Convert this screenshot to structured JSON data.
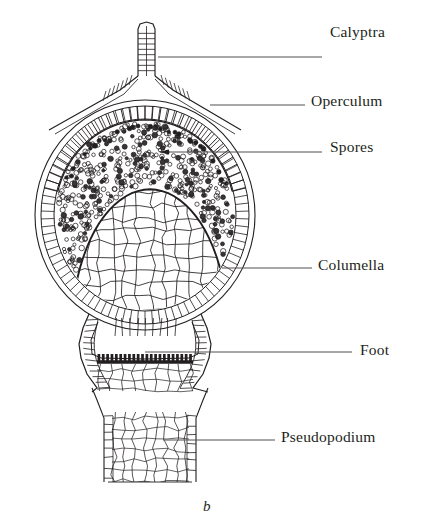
{
  "figure": {
    "caption": "b",
    "caption_x": 203,
    "caption_y": 498,
    "background": "#ffffff",
    "ink": "#231f20",
    "line_color": "#55514f"
  },
  "labels": [
    {
      "id": "calyptra",
      "text": "Calyptra",
      "text_x": 330,
      "text_y": 23,
      "leader": {
        "x1": 158,
        "y1": 57,
        "x2": 322,
        "y2": 57
      },
      "terminus": "none"
    },
    {
      "id": "operculum",
      "text": "Operculum",
      "text_x": 311,
      "text_y": 92,
      "leader": {
        "x1": 210,
        "y1": 105,
        "x2": 305,
        "y2": 105
      },
      "terminus": "none"
    },
    {
      "id": "spores",
      "text": "Spores",
      "text_x": 330,
      "text_y": 138,
      "leader": {
        "x1": 160,
        "y1": 152,
        "x2": 322,
        "y2": 152
      },
      "terminus": "arrow"
    },
    {
      "id": "columella",
      "text": "Columella",
      "text_x": 318,
      "text_y": 256,
      "leader": {
        "x1": 222,
        "y1": 268,
        "x2": 312,
        "y2": 268
      },
      "terminus": "none"
    },
    {
      "id": "foot",
      "text": "Foot",
      "text_x": 360,
      "text_y": 341,
      "leader": {
        "x1": 145,
        "y1": 352,
        "x2": 352,
        "y2": 352
      },
      "terminus": "none"
    },
    {
      "id": "pseudopodium",
      "text": "Pseudopodium",
      "text_x": 281,
      "text_y": 428,
      "leader": {
        "x1": 163,
        "y1": 440,
        "x2": 275,
        "y2": 440
      },
      "terminus": "none"
    }
  ],
  "structures": {
    "calyptra": {
      "name": "Calyptra",
      "stalk_left": 138,
      "stalk_right": 155,
      "tip_y": 22,
      "flare_y": 76,
      "rows": 9
    },
    "operculum": {
      "name": "Operculum",
      "apex_y": 100,
      "cells": 34
    },
    "capsule": {
      "name": "Capsule",
      "cx": 145,
      "cy": 215,
      "rx": 110,
      "ry": 115,
      "wall_layers": 3
    },
    "spore_cavity": {
      "name": "Spore cavity",
      "spore_count": 470,
      "spore_radius": 2.0
    },
    "columella": {
      "name": "Columella",
      "cx": 150,
      "top_y": 185,
      "bottom_y": 330,
      "half_width": 78,
      "cell_size": 13
    },
    "foot": {
      "name": "Foot",
      "top_y": 330,
      "band_y": 360,
      "bottom_y": 392,
      "band_teeth": 22
    },
    "pseudopodium": {
      "name": "Pseudopodium",
      "left": 104,
      "right": 196,
      "top_y": 392,
      "bottom_y": 482,
      "cell_rows": 14
    }
  }
}
